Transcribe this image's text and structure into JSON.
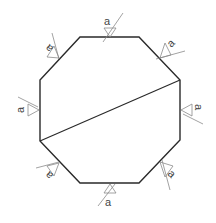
{
  "diagram": {
    "title": "",
    "shape": "octagon with diagonal cut",
    "weld_symbols": [
      {
        "edge": "top",
        "label": "a"
      },
      {
        "edge": "top-right",
        "label": "a"
      },
      {
        "edge": "right",
        "label": "a"
      },
      {
        "edge": "bottom-right",
        "label": "a"
      },
      {
        "edge": "bottom",
        "label": "a"
      },
      {
        "edge": "bottom-left",
        "label": "a"
      },
      {
        "edge": "left",
        "label": "a"
      },
      {
        "edge": "top-left",
        "label": "a"
      }
    ],
    "colors": {
      "outline": "#2a2a2a",
      "symbol": "#8a8a8a",
      "label": "#444444"
    }
  }
}
